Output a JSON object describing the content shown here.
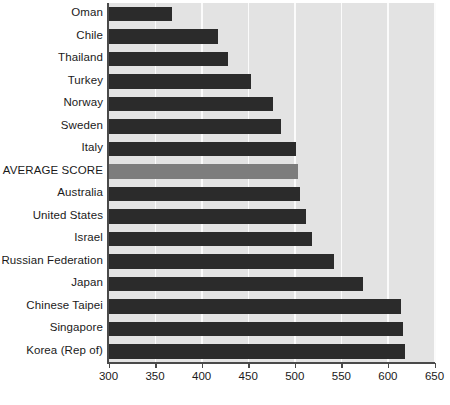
{
  "chart_data": {
    "type": "bar",
    "orientation": "horizontal",
    "title": "",
    "subtitle": "",
    "xlabel": "",
    "ylabel": "",
    "xlim": [
      300,
      650
    ],
    "xticks": [
      300,
      350,
      400,
      450,
      500,
      550,
      600,
      650
    ],
    "xtick_labels": [
      "300",
      "350",
      "400",
      "450",
      "500",
      "550",
      "600",
      "650"
    ],
    "grid": true,
    "grid_axis": "x",
    "legend": null,
    "legend_position": "none",
    "plot_background": "#e3e3e3",
    "gridline_color": "#fbfbfb",
    "bar_color": "#2b2b2b",
    "highlight_color": "#7d7d7d",
    "categories": [
      "Oman",
      "Chile",
      "Thailand",
      "Turkey",
      "Norway",
      "Sweden",
      "Italy",
      "AVERAGE SCORE",
      "Australia",
      "United States",
      "Israel",
      "Russian Federation",
      "Japan",
      "Chinese Taipei",
      "Singapore",
      "Korea (Rep of)"
    ],
    "values": [
      368,
      418,
      428,
      453,
      477,
      485,
      501,
      503,
      506,
      512,
      519,
      542,
      573,
      614,
      616,
      618
    ],
    "highlighted": [
      "AVERAGE SCORE"
    ],
    "bars": [
      {
        "label": "Oman",
        "value": 368,
        "highlight": false
      },
      {
        "label": "Chile",
        "value": 418,
        "highlight": false
      },
      {
        "label": "Thailand",
        "value": 428,
        "highlight": false
      },
      {
        "label": "Turkey",
        "value": 453,
        "highlight": false
      },
      {
        "label": "Norway",
        "value": 477,
        "highlight": false
      },
      {
        "label": "Sweden",
        "value": 485,
        "highlight": false
      },
      {
        "label": "Italy",
        "value": 501,
        "highlight": false
      },
      {
        "label": "AVERAGE SCORE",
        "value": 503,
        "highlight": true
      },
      {
        "label": "Australia",
        "value": 506,
        "highlight": false
      },
      {
        "label": "United States",
        "value": 512,
        "highlight": false
      },
      {
        "label": "Israel",
        "value": 519,
        "highlight": false
      },
      {
        "label": "Russian Federation",
        "value": 542,
        "highlight": false
      },
      {
        "label": "Japan",
        "value": 573,
        "highlight": false
      },
      {
        "label": "Chinese Taipei",
        "value": 614,
        "highlight": false
      },
      {
        "label": "Singapore",
        "value": 616,
        "highlight": false
      },
      {
        "label": "Korea (Rep of)",
        "value": 618,
        "highlight": false
      }
    ]
  }
}
